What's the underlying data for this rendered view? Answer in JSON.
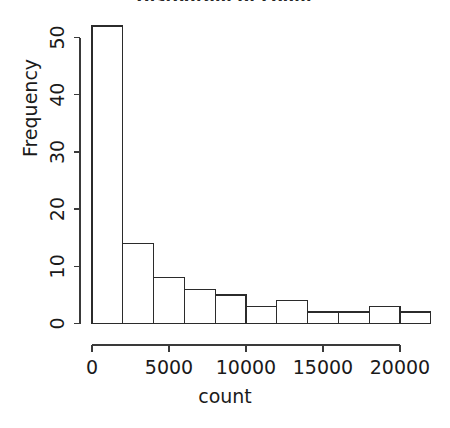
{
  "chart_data": {
    "type": "bar",
    "subtype": "histogram",
    "title": "Histogram of count",
    "title_visible_fragment": "g",
    "title_clipped": true,
    "xlabel": "count",
    "ylabel": "Frequency",
    "xlim": [
      -500,
      22600
    ],
    "ylim": [
      0,
      53
    ],
    "xticks": [
      0,
      5000,
      10000,
      15000,
      20000
    ],
    "xtick_labels": [
      "0",
      "5000",
      "10000",
      "15000",
      "20000"
    ],
    "yticks": [
      0,
      10,
      20,
      30,
      40,
      50
    ],
    "ytick_labels": [
      "0",
      "10",
      "20",
      "30",
      "40",
      "50"
    ],
    "grid": false,
    "legend": false,
    "bin_width": 2000,
    "bin_edges": [
      0,
      2000,
      4000,
      6000,
      8000,
      10000,
      12000,
      14000,
      16000,
      18000,
      20000,
      22000
    ],
    "categories": [
      "0-2000",
      "2000-4000",
      "4000-6000",
      "6000-8000",
      "8000-10000",
      "10000-12000",
      "12000-14000",
      "14000-16000",
      "16000-18000",
      "18000-20000",
      "20000-22000"
    ],
    "values": [
      52,
      14,
      8,
      6,
      5,
      3,
      4,
      2,
      2,
      3,
      2
    ],
    "bar_fill": "#ffffff",
    "bar_stroke": "#2b2b2b",
    "background": "#ffffff"
  }
}
